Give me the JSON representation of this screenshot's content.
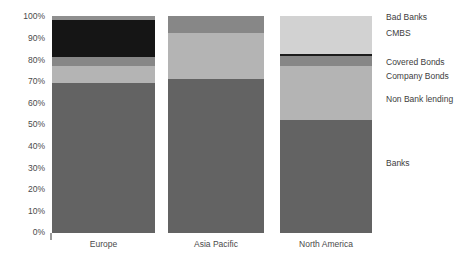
{
  "chart_data": {
    "type": "bar",
    "title": "",
    "subtitle": "",
    "xlabel": "",
    "ylabel": "",
    "stacked": true,
    "stack_mode": "percent",
    "orientation": "vertical",
    "grid": false,
    "legend_position": "right",
    "ylim": [
      0,
      100
    ],
    "yticks": [
      0,
      10,
      20,
      30,
      40,
      50,
      60,
      70,
      80,
      90,
      100
    ],
    "ytick_labels": [
      "0%",
      "10%",
      "20%",
      "30%",
      "40%",
      "50%",
      "60%",
      "70%",
      "80%",
      "90%",
      "100%"
    ],
    "categories": [
      "Europe",
      "Asia Pacific",
      "North America"
    ],
    "series": [
      {
        "name": "Banks",
        "color": "#636363",
        "values": [
          69,
          71,
          52
        ]
      },
      {
        "name": "Non Bank lending",
        "color": "#b4b4b4",
        "values": [
          8,
          21,
          25
        ]
      },
      {
        "name": "Company Bonds",
        "color": "#878787",
        "values": [
          4,
          8,
          4.5
        ]
      },
      {
        "name": "Covered Bonds",
        "color": "#1c1c1c",
        "values": [
          0,
          0,
          0.8
        ]
      },
      {
        "name": "CMBS",
        "color": "#d2d2d2",
        "values": [
          17,
          0,
          17.7
        ]
      },
      {
        "name": "Bad Banks",
        "color": "#8f8f8f",
        "values": [
          2,
          0,
          0
        ]
      }
    ]
  },
  "legend": {
    "items": [
      {
        "label": "Bad Banks",
        "top": 13
      },
      {
        "label": "CMBS",
        "top": 29
      },
      {
        "label": "Covered Bonds",
        "top": 58
      },
      {
        "label": "Company Bonds",
        "top": 72
      },
      {
        "label": "Non Bank lending",
        "top": 95
      },
      {
        "label": "Banks",
        "top": 159
      }
    ]
  },
  "axis": {
    "y_ticks": [
      {
        "label": "100%",
        "top": 12
      },
      {
        "label": "90%",
        "top": 34
      },
      {
        "label": "80%",
        "top": 56
      },
      {
        "label": "70%",
        "top": 77
      },
      {
        "label": "60%",
        "top": 99
      },
      {
        "label": "50%",
        "top": 120
      },
      {
        "label": "40%",
        "top": 142
      },
      {
        "label": "30%",
        "top": 164
      },
      {
        "label": "20%",
        "top": 185
      },
      {
        "label": "10%",
        "top": 207
      },
      {
        "label": "0%",
        "top": 228
      }
    ]
  },
  "bars": [
    {
      "category": "Europe",
      "left": 0,
      "width": 103,
      "label_left": 0,
      "label_width": 103,
      "segments": [
        {
          "series": "Bad Banks",
          "color": "#8f8f8f",
          "from": 98,
          "to": 100
        },
        {
          "series": "CMBS",
          "color": "#151515",
          "from": 81,
          "to": 98
        },
        {
          "series": "Company Bonds",
          "color": "#878787",
          "from": 77,
          "to": 81
        },
        {
          "series": "Non Bank lending",
          "color": "#b4b4b4",
          "from": 69,
          "to": 77
        },
        {
          "series": "Banks",
          "color": "#636363",
          "from": 0,
          "to": 69
        }
      ]
    },
    {
      "category": "Asia Pacific",
      "left": 116,
      "width": 96,
      "label_left": 116,
      "label_width": 96,
      "segments": [
        {
          "series": "Company Bonds",
          "color": "#878787",
          "from": 92,
          "to": 100
        },
        {
          "series": "Non Bank lending",
          "color": "#b4b4b4",
          "from": 71,
          "to": 92
        },
        {
          "series": "Banks",
          "color": "#636363",
          "from": 0,
          "to": 71
        }
      ]
    },
    {
      "category": "North America",
      "left": 228,
      "width": 92,
      "label_left": 228,
      "label_width": 92,
      "segments": [
        {
          "series": "CMBS",
          "color": "#d2d2d2",
          "from": 82.3,
          "to": 100
        },
        {
          "series": "Covered Bonds",
          "color": "#1c1c1c",
          "from": 81.5,
          "to": 82.3
        },
        {
          "series": "Company Bonds",
          "color": "#878787",
          "from": 77,
          "to": 81.5
        },
        {
          "series": "Non Bank lending",
          "color": "#b4b4b4",
          "from": 52,
          "to": 77
        },
        {
          "series": "Banks",
          "color": "#636363",
          "from": 0,
          "to": 52
        }
      ]
    }
  ]
}
